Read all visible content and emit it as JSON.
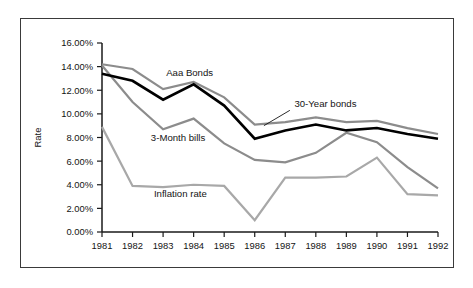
{
  "chart_data": {
    "type": "line",
    "title": "",
    "xlabel": "",
    "ylabel": "Rate",
    "x": [
      "1981",
      "1982",
      "1983",
      "1984",
      "1985",
      "1986",
      "1987",
      "1988",
      "1989",
      "1990",
      "1991",
      "1992"
    ],
    "categories": [
      "1981",
      "1982",
      "1983",
      "1984",
      "1985",
      "1986",
      "1987",
      "1988",
      "1989",
      "1990",
      "1991",
      "1992"
    ],
    "ylim": [
      0,
      16
    ],
    "yticks": [
      0,
      2,
      4,
      6,
      8,
      10,
      12,
      14,
      16
    ],
    "ytick_labels": [
      "0.00%",
      "2.00%",
      "4.00%",
      "6.00%",
      "8.00%",
      "10.00%",
      "12.00%",
      "14.00%",
      "16.00%"
    ],
    "grid": false,
    "legend": "inline-annotations",
    "series": [
      {
        "name": "Aaa Bonds",
        "color": "#8c8c8c",
        "stroke_width": 2.2,
        "label_x": 1983.1,
        "label_y": 13.2,
        "values": [
          14.2,
          13.8,
          12.1,
          12.7,
          11.4,
          9.1,
          9.3,
          9.7,
          9.3,
          9.4,
          8.8,
          8.3
        ]
      },
      {
        "name": "30-Year bonds",
        "color": "#000000",
        "stroke_width": 2.6,
        "label_x": 1987.3,
        "label_y": 10.6,
        "values": [
          13.4,
          12.8,
          11.2,
          12.5,
          10.7,
          7.9,
          8.6,
          9.1,
          8.6,
          8.8,
          8.3,
          7.9
        ]
      },
      {
        "name": "3-Month bills",
        "color": "#8c8c8c",
        "stroke_width": 2.2,
        "label_x": 1982.6,
        "label_y": 7.7,
        "values": [
          14.1,
          11.0,
          8.7,
          9.6,
          7.5,
          6.1,
          5.9,
          6.7,
          8.4,
          7.6,
          5.5,
          3.7
        ]
      },
      {
        "name": "Inflation rate",
        "color": "#a8a8a8",
        "stroke_width": 2.2,
        "label_x": 1982.7,
        "label_y": 3.0,
        "values": [
          8.9,
          3.9,
          3.8,
          4.0,
          3.9,
          1.0,
          4.6,
          4.6,
          4.7,
          6.3,
          3.2,
          3.1
        ]
      }
    ],
    "annotations": [
      {
        "text": "30-Year bonds",
        "leader_from_x": 1987.15,
        "leader_from_y": 10.3,
        "leader_to_x": 1986.3,
        "leader_to_y": 9.0
      }
    ]
  },
  "colors": {
    "background": "#ffffff",
    "frame_border": "#3a3a3a",
    "axis": "#1a1a1a",
    "text": "#141414",
    "series_black": "#000000",
    "series_gray": "#8c8c8c",
    "series_light_gray": "#a8a8a8"
  }
}
